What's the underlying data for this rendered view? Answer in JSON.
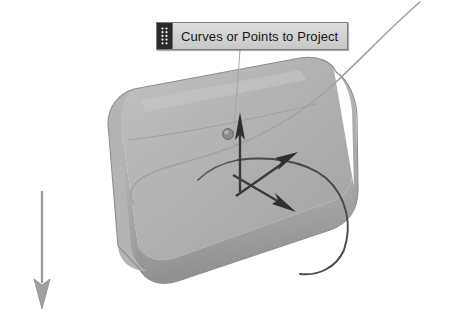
{
  "app": {
    "background_color": "#ffffff",
    "view": "3d-perspective-viewport"
  },
  "callout": {
    "label": "Curves or Points to Project",
    "grip_icon": "dot-grid-grip-icon",
    "background_color": "#d4d4d4",
    "border_color": "#7c7c7c",
    "text_color": "#161616",
    "grip_color": "#2a2a2a"
  },
  "scene": {
    "surface": {
      "name": "curved-cylindrical-surface",
      "fill_light": "#bdbdbd",
      "fill_mid": "#ababab",
      "fill_dark": "#9a9a9a",
      "edge_color": "#8a8a8a"
    },
    "projected_curve": {
      "name": "projected-curve-on-surface",
      "color": "#4a4a4a"
    },
    "source_curve": {
      "name": "source-curve-to-project",
      "color": "#9f9f9f"
    },
    "leader_line": {
      "name": "callout-leader-line",
      "color": "#9a9a9a"
    },
    "point_marker": {
      "name": "selected-point-marker",
      "color": "#6e6e6e"
    },
    "gumball": {
      "name": "manipulator-arrow-triad",
      "color": "#3a3a3a",
      "arrows": [
        {
          "name": "gumball-arrow-up",
          "direction": "up"
        },
        {
          "name": "gumball-arrow-up-right",
          "direction": "up-right"
        },
        {
          "name": "gumball-arrow-down-right",
          "direction": "down-right"
        }
      ]
    },
    "direction_arrow": {
      "name": "projection-direction-arrow",
      "direction": "down",
      "color": "#9a9a9a"
    }
  }
}
